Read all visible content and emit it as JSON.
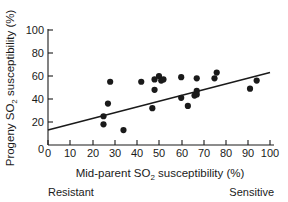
{
  "chart_data": {
    "type": "scatter",
    "title": "",
    "xlabel": "Mid-parent SO2 susceptibility (%)",
    "ylabel": "Progeny SO2 susceptibility (%)",
    "xlabel_parts": {
      "pre": "Mid-parent SO",
      "sub": "2",
      "post": " susceptibility (%)"
    },
    "ylabel_parts": {
      "pre": "Progeny SO",
      "sub": "2",
      "post": " susceptibility (%)"
    },
    "xlim": [
      0,
      100
    ],
    "ylim": [
      0,
      100
    ],
    "xticks": [
      0,
      10,
      20,
      30,
      40,
      50,
      60,
      70,
      80,
      90,
      100
    ],
    "yticks": [
      0,
      20,
      40,
      60,
      80,
      100
    ],
    "xtick_labels": [
      "0",
      "10",
      "20",
      "30",
      "40",
      "50",
      "60",
      "70",
      "80",
      "90",
      "100"
    ],
    "ytick_labels": [
      "0",
      "20",
      "40",
      "60",
      "80",
      "100"
    ],
    "grid": false,
    "legend": false,
    "marker": "filled-circle",
    "marker_color": "#1a1a1a",
    "points": [
      {
        "x": 25,
        "y": 25
      },
      {
        "x": 25,
        "y": 18
      },
      {
        "x": 27,
        "y": 36
      },
      {
        "x": 28,
        "y": 55
      },
      {
        "x": 34,
        "y": 13
      },
      {
        "x": 42,
        "y": 55
      },
      {
        "x": 47,
        "y": 32
      },
      {
        "x": 48,
        "y": 48
      },
      {
        "x": 48,
        "y": 57
      },
      {
        "x": 50,
        "y": 60
      },
      {
        "x": 51,
        "y": 56
      },
      {
        "x": 52,
        "y": 57
      },
      {
        "x": 60,
        "y": 59
      },
      {
        "x": 60,
        "y": 41
      },
      {
        "x": 63,
        "y": 34
      },
      {
        "x": 66,
        "y": 43
      },
      {
        "x": 67,
        "y": 47
      },
      {
        "x": 67,
        "y": 58
      },
      {
        "x": 67,
        "y": 44
      },
      {
        "x": 75,
        "y": 58
      },
      {
        "x": 76,
        "y": 63
      },
      {
        "x": 91,
        "y": 49
      },
      {
        "x": 94,
        "y": 56
      }
    ],
    "fit_line": {
      "label": "regression-line",
      "x_start": 0,
      "y_start": 13,
      "x_end": 100,
      "y_end": 63
    },
    "annotations": {
      "left_endpoint": "Resistant",
      "right_endpoint": "Sensitive"
    }
  }
}
